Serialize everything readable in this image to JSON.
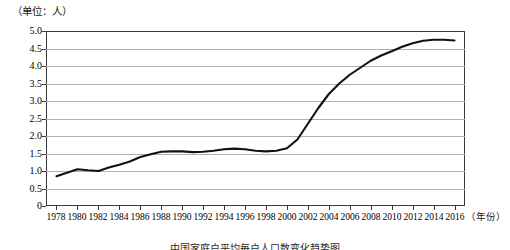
{
  "unit_label": "（单位：人）",
  "xaxis_title": "（年份）",
  "caption": "中国家庭户平均每户人口数变化趋势图",
  "colors": {
    "line": "#111111",
    "grid": "#b0b0b0",
    "frame": "#3a3a3a",
    "background": "#ffffff"
  },
  "chart_data": {
    "type": "line",
    "title": "",
    "subtitle": "",
    "xlabel": "（年份）",
    "ylabel": "（单位：人）",
    "xlim": [
      1977,
      2017
    ],
    "ylim": [
      0,
      5.0
    ],
    "grid": true,
    "legend": "none",
    "ytick_labels": [
      "0",
      "0.5",
      "1.0",
      "1.5",
      "2.0",
      "2.5",
      "3.0",
      "3.5",
      "4.0",
      "4.5",
      "5.0"
    ],
    "ytick_values": [
      0,
      0.5,
      1.0,
      1.5,
      2.0,
      2.5,
      3.0,
      3.5,
      4.0,
      4.5,
      5.0
    ],
    "xtick_labels": [
      "1978",
      "1980",
      "1982",
      "1984",
      "1986",
      "1988",
      "1990",
      "1992",
      "1994",
      "1996",
      "1998",
      "2000",
      "2002",
      "2004",
      "2006",
      "2008",
      "2010",
      "2012",
      "2014",
      "2016"
    ],
    "xtick_values": [
      1978,
      1980,
      1982,
      1984,
      1986,
      1988,
      1990,
      1992,
      1994,
      1996,
      1998,
      2000,
      2002,
      2004,
      2006,
      2008,
      2010,
      2012,
      2014,
      2016
    ],
    "series": [
      {
        "name": "人数",
        "x": [
          1978,
          1979,
          1980,
          1981,
          1982,
          1983,
          1984,
          1985,
          1986,
          1987,
          1988,
          1989,
          1990,
          1991,
          1992,
          1993,
          1994,
          1995,
          1996,
          1997,
          1998,
          1999,
          2000,
          2001,
          2002,
          2003,
          2004,
          2005,
          2006,
          2007,
          2008,
          2009,
          2010,
          2011,
          2012,
          2013,
          2014,
          2015,
          2016
        ],
        "values": [
          0.85,
          0.95,
          1.05,
          1.02,
          1.0,
          1.1,
          1.18,
          1.27,
          1.4,
          1.48,
          1.55,
          1.56,
          1.56,
          1.54,
          1.55,
          1.58,
          1.62,
          1.64,
          1.62,
          1.58,
          1.56,
          1.58,
          1.65,
          1.9,
          2.35,
          2.8,
          3.2,
          3.5,
          3.75,
          3.95,
          4.15,
          4.3,
          4.42,
          4.55,
          4.65,
          4.72,
          4.75,
          4.75,
          4.73
        ]
      }
    ]
  }
}
